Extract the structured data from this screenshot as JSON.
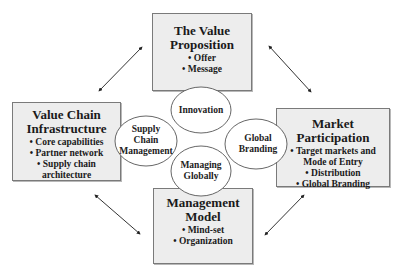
{
  "boxes": {
    "top": {
      "title": [
        "The Value",
        "Proposition"
      ],
      "items": [
        "Offer",
        "Message"
      ]
    },
    "left": {
      "title": [
        "Value Chain",
        "Infrastructure"
      ],
      "items": [
        "Core capabilities",
        "Partner network",
        "Supply chain",
        "architecture"
      ]
    },
    "right": {
      "title": [
        "Market",
        "Participation"
      ],
      "items": [
        "Target markets and",
        "Mode of Entry",
        "Distribution",
        "Global Branding"
      ]
    },
    "bottom": {
      "title": [
        "Management",
        "Model"
      ],
      "items": [
        "Mind-set",
        "Organization"
      ]
    }
  },
  "circles": {
    "innovation": [
      "Innovation"
    ],
    "supply_chain": [
      "Supply",
      "Chain",
      "Management"
    ],
    "global_branding": [
      "Global",
      "Branding"
    ],
    "managing_globally": [
      "Managing",
      "Globally"
    ]
  },
  "arrows": [
    "top-left",
    "top-right",
    "bottom-left",
    "bottom-right"
  ]
}
